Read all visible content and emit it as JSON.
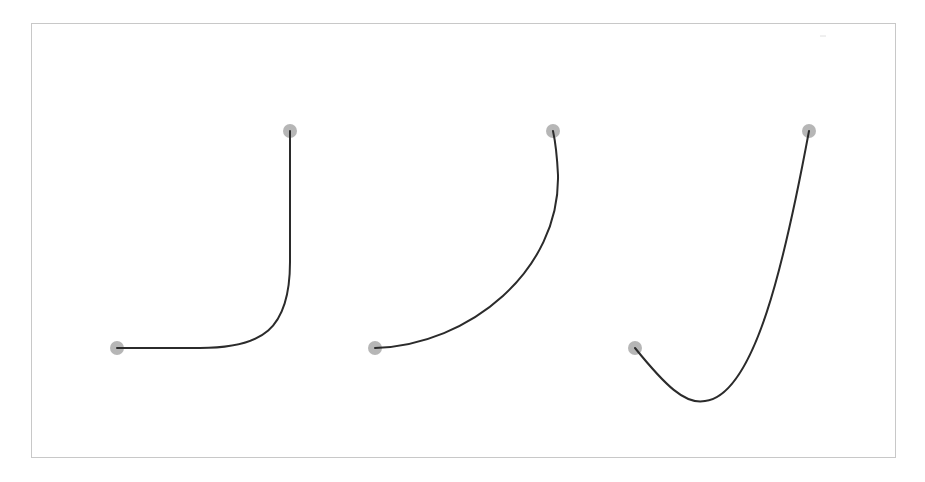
{
  "canvas": {
    "width": 925,
    "height": 482,
    "background": "#ffffff"
  },
  "frame": {
    "x": 31,
    "y": 23,
    "width": 864,
    "height": 434,
    "stroke": "#c8c8c8"
  },
  "style": {
    "curve_color": "#2b2b2b",
    "curve_width": 2,
    "handle_color": "#a9a9a9",
    "handle_radius": 7
  },
  "curves": [
    {
      "id": "curve-1",
      "description": "sharp corner bezier",
      "start": {
        "x": 117,
        "y": 348
      },
      "end": {
        "x": 290,
        "y": 131
      },
      "path": "M117,348 L200,348 C262,348 290,330 290,262 L290,131"
    },
    {
      "id": "curve-2",
      "description": "smooth arc bezier",
      "start": {
        "x": 375,
        "y": 348
      },
      "end": {
        "x": 553,
        "y": 131
      },
      "path": "M375,348 C470,345 560,270 558,175 C557,155 555,140 553,131"
    },
    {
      "id": "curve-3",
      "description": "dipping bezier",
      "start": {
        "x": 635,
        "y": 348
      },
      "end": {
        "x": 809,
        "y": 131
      },
      "path": "M635,348 C665,385 685,405 705,401 C755,395 785,260 809,131"
    }
  ]
}
